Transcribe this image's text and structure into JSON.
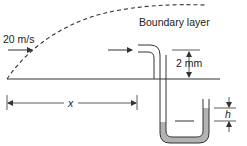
{
  "diagram": {
    "labels": {
      "velocity": "20 m/s",
      "boundary_layer": "Boundary layer",
      "probe_height": "2 mm",
      "distance": "x",
      "manometer_head": "h"
    },
    "colors": {
      "line": "#333333",
      "fluid": "#b3b3b3",
      "background": "#ffffff"
    }
  }
}
